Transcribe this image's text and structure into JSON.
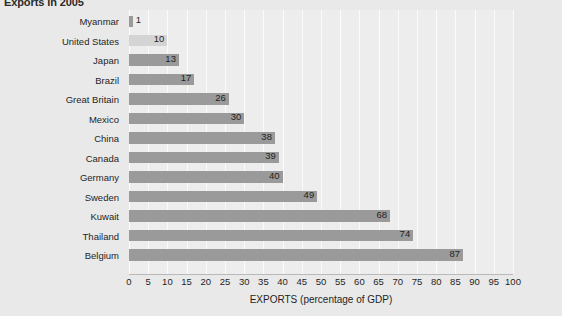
{
  "chart_data": {
    "type": "bar",
    "orientation": "horizontal",
    "title": "Exports in 2005",
    "xlabel": "EXPORTS (percentage of GDP)",
    "ylabel": "",
    "xlim": [
      0,
      100
    ],
    "xticks": [
      0,
      5,
      10,
      15,
      20,
      25,
      30,
      35,
      40,
      45,
      50,
      55,
      60,
      65,
      70,
      75,
      80,
      85,
      90,
      95,
      100
    ],
    "grid": true,
    "legend": "none",
    "categories": [
      "Myanmar",
      "United States",
      "Japan",
      "Brazil",
      "Great Britain",
      "Mexico",
      "China",
      "Canada",
      "Germany",
      "Sweden",
      "Kuwait",
      "Thailand",
      "Belgium"
    ],
    "values": [
      1,
      10,
      13,
      17,
      26,
      30,
      38,
      39,
      40,
      49,
      68,
      74,
      87
    ],
    "highlighted_category": "United States",
    "colors": {
      "bar": "#9a9a9a",
      "bar_highlight": "#d4d4d4",
      "plot_background": "#ededed",
      "page_background": "#e9e9e9",
      "gridline": "#fbfbfb",
      "text": "#1f1f1f"
    }
  }
}
